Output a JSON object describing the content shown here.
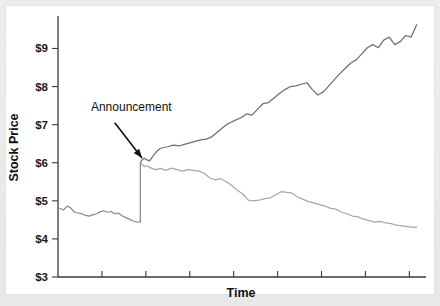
{
  "figure": {
    "background_color": "#ededed",
    "plot_background_color": "#ffffff",
    "annotation_label": "Announcement"
  },
  "chart_data": {
    "type": "line",
    "title": "",
    "xlabel": "Time",
    "ylabel": "Stock Price",
    "ylim": [
      3,
      9.8
    ],
    "xlim": [
      0,
      100
    ],
    "grid": false,
    "legend": null,
    "ytick_labels": [
      "$3",
      "$4",
      "$5",
      "$6",
      "$7",
      "$8",
      "$9"
    ],
    "ytick_values": [
      3,
      4,
      5,
      6,
      7,
      8,
      9
    ],
    "xtick_labels": [],
    "xtick_values": [
      12,
      24,
      36,
      48,
      60,
      72,
      84,
      96
    ],
    "annotations": [
      {
        "text": "Announcement",
        "text_x": 9,
        "text_y": 7.35,
        "arrow_tip_x": 23.5,
        "arrow_tip_y": 6.1,
        "arrow_tail_x": 15.5,
        "arrow_tail_y": 7.05
      }
    ],
    "event": {
      "name": "Announcement",
      "x": 22.5,
      "price_before": 4.45,
      "price_after": 6.0
    },
    "series": [
      {
        "name": "pre-announcement",
        "color": "#8a8a8a",
        "width": 1.25,
        "x": [
          0.5,
          1.5,
          2.5,
          3.5,
          4.5,
          5.5,
          6.5,
          7.5,
          8.5,
          9.5,
          10.5,
          11.5,
          12.5,
          13.5,
          14.5,
          15.5,
          16.5,
          17.5,
          18.5,
          19.5,
          20.5,
          21.5,
          22.2,
          22.5
        ],
        "values": [
          4.8,
          4.76,
          4.86,
          4.81,
          4.7,
          4.68,
          4.66,
          4.62,
          4.6,
          4.63,
          4.66,
          4.71,
          4.74,
          4.7,
          4.72,
          4.66,
          4.68,
          4.61,
          4.56,
          4.52,
          4.47,
          4.45,
          4.44,
          4.45
        ]
      },
      {
        "name": "post-announcement-upper",
        "color": "#6e6e6e",
        "width": 1.25,
        "x": [
          22.5,
          23.0,
          23.6,
          24.2,
          25.0,
          26.0,
          27.0,
          28.0,
          29.0,
          30.0,
          31.5,
          33.0,
          34.5,
          36.0,
          37.5,
          39.0,
          40.5,
          42.0,
          43.5,
          45.0,
          46.0,
          47.0,
          48.5,
          50.0,
          51.5,
          53.0,
          54.5,
          56.0,
          57.5,
          59.0,
          60.5,
          62.0,
          63.5,
          65.0,
          66.5,
          68.0,
          69.5,
          71.0,
          72.5,
          74.0,
          75.5,
          77.0,
          78.5,
          80.0,
          81.5,
          83.0,
          84.5,
          86.0,
          87.5,
          89.0,
          90.5,
          92.0,
          93.5,
          95.0,
          96.5,
          98.0
        ],
        "values": [
          6.0,
          6.08,
          6.12,
          6.08,
          6.05,
          6.18,
          6.3,
          6.38,
          6.4,
          6.42,
          6.46,
          6.44,
          6.48,
          6.52,
          6.56,
          6.6,
          6.62,
          6.68,
          6.8,
          6.92,
          7.0,
          7.05,
          7.12,
          7.18,
          7.28,
          7.25,
          7.4,
          7.55,
          7.58,
          7.7,
          7.82,
          7.92,
          8.0,
          8.02,
          8.06,
          8.1,
          7.92,
          7.78,
          7.86,
          8.02,
          8.18,
          8.34,
          8.48,
          8.62,
          8.7,
          8.86,
          9.02,
          9.1,
          9.02,
          9.22,
          9.3,
          9.1,
          9.18,
          9.34,
          9.3,
          9.62
        ]
      },
      {
        "name": "post-announcement-lower",
        "color": "#a8a8a8",
        "width": 1.25,
        "x": [
          22.5,
          23.0,
          23.6,
          24.2,
          25.0,
          26.0,
          27.0,
          28.0,
          29.5,
          31.0,
          32.5,
          34.0,
          35.5,
          37.0,
          38.5,
          40.0,
          41.5,
          43.0,
          44.5,
          46.0,
          47.5,
          49.0,
          50.5,
          52.0,
          53.5,
          55.0,
          56.5,
          58.0,
          59.5,
          61.0,
          62.5,
          64.0,
          65.5,
          67.0,
          68.5,
          70.0,
          71.5,
          73.0,
          74.5,
          76.0,
          77.5,
          79.0,
          80.5,
          82.0,
          83.5,
          85.0,
          86.5,
          88.0,
          89.5,
          91.0,
          92.5,
          94.0,
          95.5,
          97.0,
          98.0
        ],
        "values": [
          6.0,
          5.96,
          5.9,
          5.92,
          5.88,
          5.84,
          5.82,
          5.85,
          5.8,
          5.86,
          5.82,
          5.78,
          5.82,
          5.8,
          5.78,
          5.72,
          5.6,
          5.55,
          5.58,
          5.5,
          5.4,
          5.28,
          5.18,
          5.02,
          5.0,
          5.02,
          5.06,
          5.08,
          5.16,
          5.24,
          5.22,
          5.2,
          5.1,
          5.04,
          4.98,
          4.94,
          4.9,
          4.86,
          4.8,
          4.78,
          4.7,
          4.66,
          4.6,
          4.58,
          4.52,
          4.48,
          4.44,
          4.46,
          4.42,
          4.4,
          4.36,
          4.34,
          4.32,
          4.3,
          4.31
        ]
      }
    ]
  }
}
